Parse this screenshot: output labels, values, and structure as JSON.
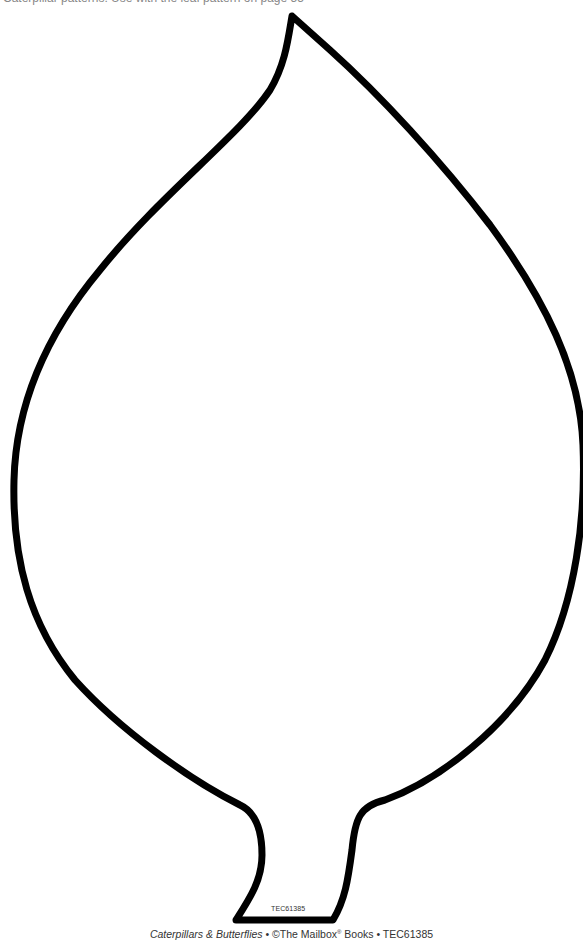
{
  "page": {
    "top_text_partial": "Caterpillar patterns: Use with the leaf pattern on page 55",
    "shape": "leaf-outline",
    "outline_color": "#000000",
    "background_color": "#ffffff"
  },
  "stem_label": "TEC61385",
  "footer": {
    "book_title": "Caterpillars & Butterflies",
    "separator1": " • ©The Mailbox",
    "registered_mark": "®",
    "publisher_suffix": " Books • TEC61385"
  }
}
